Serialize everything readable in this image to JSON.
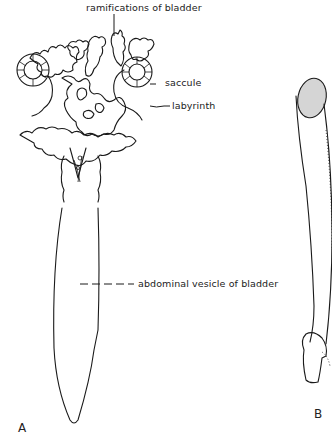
{
  "figure": {
    "panels": [
      {
        "id": "A",
        "letter": "A",
        "labels": {
          "ramifications": "ramifications of bladder",
          "saccule": "saccule",
          "labyrinth": "labyrinth",
          "abdominal_vesicle": "abdominal vesicle of bladder"
        }
      },
      {
        "id": "B",
        "letter": "B"
      }
    ],
    "colors": {
      "ink": "#1a1a1a",
      "background": "#ffffff"
    }
  }
}
